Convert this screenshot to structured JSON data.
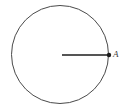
{
  "figure": {
    "kind": "geometry-diagram",
    "background_color": "#ffffff",
    "stroke_color": "#4a4a4a",
    "radius_color": "#1c1c1c",
    "label_color": "#3a3a3a"
  },
  "circle": {
    "name": "circle-outline",
    "center_x": 60,
    "center_y": 54.5,
    "radius_x": 48.5,
    "radius_y": 49,
    "stroke_width": 1
  },
  "radius": {
    "name": "radius-segment",
    "x1": 62,
    "y1": 55,
    "x2": 109,
    "y2": 55,
    "stroke_width": 1.6
  },
  "points": [
    {
      "id": "A",
      "label": "A",
      "name": "point-a",
      "x": 109,
      "y": 55,
      "marker_radius": 2.2
    }
  ],
  "labels": {
    "point_a": "A"
  }
}
